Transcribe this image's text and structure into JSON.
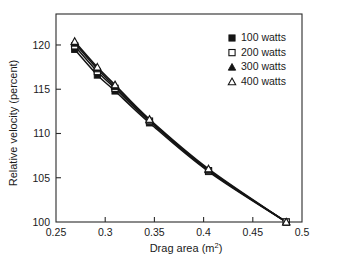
{
  "chart_data": {
    "type": "line",
    "title": "",
    "xlabel": "Drag area (m2)",
    "xlabel_base": "Drag area (m",
    "xlabel_sup": "2",
    "xlabel_close": ")",
    "ylabel": "Relative velocity (percent)",
    "xlim": [
      0.25,
      0.5
    ],
    "ylim": [
      100,
      123.5
    ],
    "xticks": [
      0.25,
      0.3,
      0.35,
      0.4,
      0.45,
      0.5
    ],
    "xtick_labels": [
      "0.25",
      "0.3",
      "0.35",
      "0.4",
      "0.45",
      "0.5"
    ],
    "yticks": [
      100,
      105,
      110,
      115,
      120
    ],
    "ytick_labels": [
      "100",
      "105",
      "110",
      "115",
      "120"
    ],
    "grid": false,
    "legend_position": "top-right",
    "x": [
      0.269,
      0.292,
      0.31,
      0.345,
      0.405,
      0.484
    ],
    "series": [
      {
        "name": "100 watts",
        "marker": "filled-square",
        "values": [
          119.5,
          116.6,
          114.8,
          111.2,
          105.7,
          100.0
        ]
      },
      {
        "name": "200 watts",
        "marker": "open-square",
        "values": [
          119.9,
          117.0,
          115.1,
          111.4,
          105.8,
          100.0
        ]
      },
      {
        "name": "300 watts",
        "marker": "filled-triangle",
        "values": [
          120.2,
          117.3,
          115.3,
          111.5,
          105.9,
          100.0
        ]
      },
      {
        "name": "400 watts",
        "marker": "open-triangle",
        "values": [
          120.4,
          117.5,
          115.5,
          111.6,
          106.0,
          100.0
        ]
      }
    ],
    "legend": [
      {
        "label": "100 watts",
        "marker": "filled-square"
      },
      {
        "label": "200 watts",
        "marker": "open-square"
      },
      {
        "label": "300 watts",
        "marker": "filled-triangle"
      },
      {
        "label": "400 watts",
        "marker": "open-triangle"
      }
    ],
    "colors": {
      "line": "#141414",
      "marker_fill": "#141414",
      "marker_open_fill": "#ffffff",
      "axis": "#2b2b2b",
      "background": "#ffffff",
      "text": "#1a1a1a"
    }
  }
}
